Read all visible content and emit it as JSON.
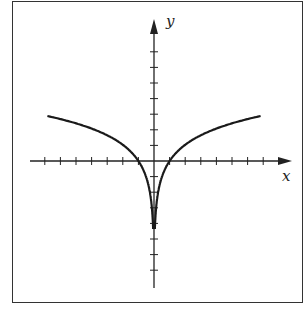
{
  "chart_data": {
    "type": "line",
    "title": "",
    "xlabel": "x",
    "ylabel": "y",
    "function_hint": "y = a·ln|x| (vertical asymptote at x = 0)",
    "x_ticks_per_side": 7,
    "y_ticks_up": 7,
    "y_ticks_down": 7,
    "xlim": [
      -7,
      7
    ],
    "ylim": [
      -7,
      7
    ],
    "grid": false,
    "legend": null,
    "series": [
      {
        "name": "left branch",
        "x": [
          -7,
          -6,
          -5,
          -4,
          -3,
          -2,
          -1,
          -0.5,
          -0.25,
          -0.1
        ],
        "y": [
          2.9,
          2.7,
          2.4,
          2.1,
          1.65,
          1.05,
          0,
          -1.05,
          -2.1,
          -3.45
        ]
      },
      {
        "name": "right branch",
        "x": [
          0.1,
          0.25,
          0.5,
          1,
          2,
          3,
          4,
          5,
          6,
          7
        ],
        "y": [
          -3.45,
          -2.1,
          -1.05,
          0,
          1.05,
          1.65,
          2.1,
          2.4,
          2.7,
          2.9
        ]
      }
    ],
    "annotations": []
  },
  "labels": {
    "x_axis": "x",
    "y_axis": "y"
  }
}
